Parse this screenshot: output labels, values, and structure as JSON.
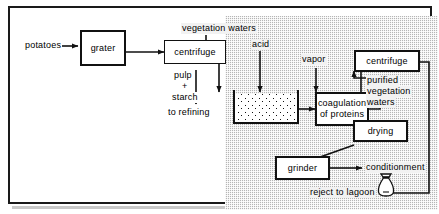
{
  "diagram": {
    "zone_label": "treatment zone (shaded)",
    "boxes": [
      {
        "id": "grater",
        "label": "grater"
      },
      {
        "id": "centrifuge1",
        "label": "centrifuge"
      },
      {
        "id": "coagulation",
        "label": "coagulation\nof proteins",
        "line1": "coagulation",
        "line2": "of proteins"
      },
      {
        "id": "centrifuge2",
        "label": "centrifuge"
      },
      {
        "id": "drying",
        "label": "drying"
      },
      {
        "id": "grinder",
        "label": "grinder"
      }
    ],
    "labels": [
      {
        "id": "potatoes",
        "text": "potatoes"
      },
      {
        "id": "vegetation-waters",
        "text": "vegetation waters"
      },
      {
        "id": "acid",
        "text": "acid"
      },
      {
        "id": "vapor",
        "text": "vapor"
      },
      {
        "id": "pulp",
        "text": "pulp"
      },
      {
        "id": "plus",
        "text": "+"
      },
      {
        "id": "starch",
        "text": "starch"
      },
      {
        "id": "to-refining",
        "text": "to refining"
      },
      {
        "id": "purified-line1",
        "text": "purified"
      },
      {
        "id": "purified-line2",
        "text": "vegetation"
      },
      {
        "id": "purified-line3",
        "text": "waters"
      },
      {
        "id": "conditionment",
        "text": "conditionment"
      },
      {
        "id": "reject-to-lagoon",
        "text": "reject to lagoon"
      }
    ],
    "vessel": {
      "id": "acidification-tank",
      "label": "acidification tank"
    },
    "icons": [
      {
        "id": "sack-icon",
        "label": "packaged product sack"
      }
    ],
    "colors": {
      "line": "#111111",
      "zone_fill": "#b5b5b5",
      "box_fill": "#ffffff",
      "frame": "#1a1a1a"
    }
  }
}
